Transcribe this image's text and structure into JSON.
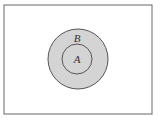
{
  "diagram": {
    "type": "venn",
    "universe": {
      "label": ""
    },
    "sets": [
      {
        "name": "B",
        "label": "B",
        "fill": "#d4d4d4",
        "contains": [
          "A"
        ]
      },
      {
        "name": "A",
        "label": "A",
        "fill": "#d4d4d4"
      }
    ],
    "colors": {
      "stroke": "#555555",
      "shade": "#d4d4d4",
      "background": "#ffffff"
    }
  }
}
